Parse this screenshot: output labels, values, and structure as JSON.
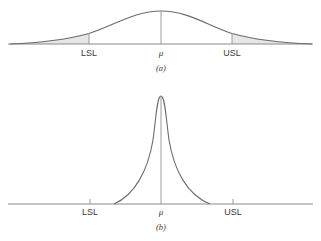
{
  "panels": [
    {
      "id": "a",
      "caption": "(a)",
      "labels": {
        "lsl": "LSL",
        "mean": "μ",
        "usl": "USL"
      },
      "description": "Wide normal distribution; tails beyond LSL and USL are shaded"
    },
    {
      "id": "b",
      "caption": "(b)",
      "labels": {
        "lsl": "LSL",
        "mean": "μ",
        "usl": "USL"
      },
      "description": "Narrow normal distribution well within LSL and USL"
    }
  ],
  "colors": {
    "curve": "#6a6a6a",
    "axis": "#8a8a8a",
    "shade": "#e4e4e4",
    "text": "#3a3a3a"
  }
}
